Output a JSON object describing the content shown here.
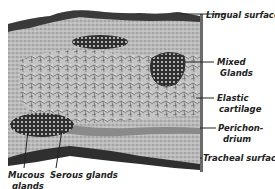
{
  "figure": {
    "labels": {
      "lingual_surface": "Lingual surface",
      "mixed_glands_1": "Mixed",
      "mixed_glands_2": "Glands",
      "elastic_cartilage_1": "Elastic",
      "elastic_cartilage_2": "cartilage",
      "perichondrium_1": "Perichon-",
      "perichondrium_2": "drium",
      "tracheal_surface": "Tracheal surface",
      "mucous_glands_1": "Mucous",
      "mucous_glands_2": "glands",
      "serous_glands": "Serous glands"
    },
    "colors": {
      "tissue_light": "#c8c8c8",
      "tissue_mid": "#9a9a9a",
      "tissue_dark": "#3a3a3a",
      "background": "#ffffff"
    }
  }
}
